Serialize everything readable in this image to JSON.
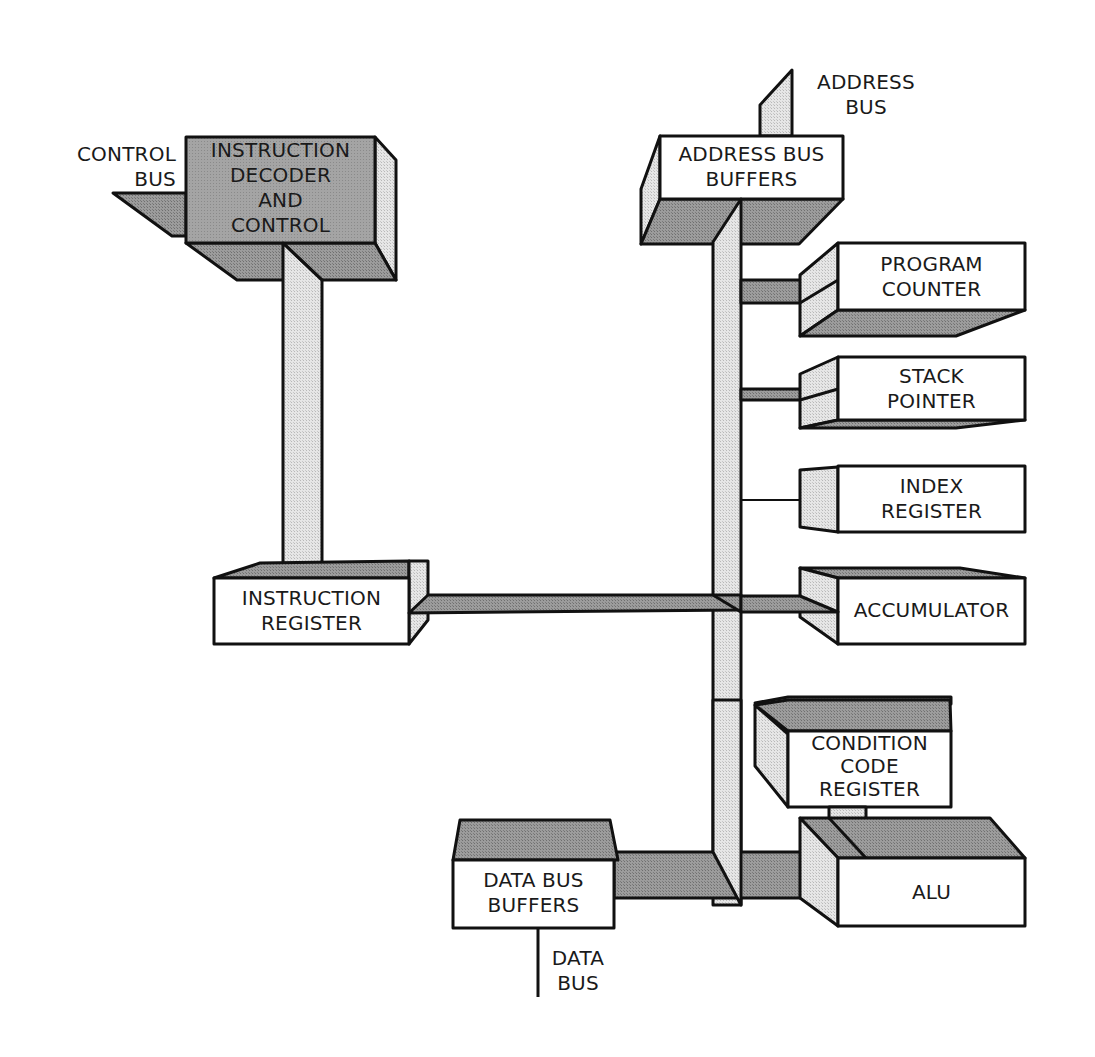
{
  "diagram": {
    "colors": {
      "front_light": "#ffffff",
      "front_dark": "#9a9a9a",
      "shade_dark": "#8e8e8e",
      "shade_light": "#dcdcdc",
      "stroke": "#111111"
    },
    "external_labels": {
      "control_bus": "CONTROL\nBUS",
      "address_bus": "ADDRESS\nBUS",
      "data_bus": "DATA\nBUS"
    },
    "blocks": {
      "instruction_decoder": "INSTRUCTION\nDECODER\nAND\nCONTROL",
      "address_bus_buffers": "ADDRESS BUS\nBUFFERS",
      "program_counter": "PROGRAM\nCOUNTER",
      "stack_pointer": "STACK\nPOINTER",
      "index_register": "INDEX\nREGISTER",
      "accumulator": "ACCUMULATOR",
      "instruction_register": "INSTRUCTION\nREGISTER",
      "condition_code_register": "CONDITION\nCODE\nREGISTER",
      "alu": "ALU",
      "data_bus_buffers": "DATA BUS\nBUFFERS"
    }
  }
}
